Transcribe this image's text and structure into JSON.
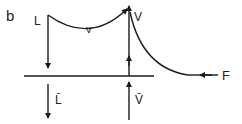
{
  "figure": {
    "panel_label": "b",
    "stroke_color": "#1a1a1a",
    "labels": {
      "liquid_top": "L",
      "vapor_flow": "v",
      "vapor_top": "V",
      "liquid_bottom": "L̄",
      "vapor_bottom": "V̄",
      "feed": "F"
    }
  }
}
